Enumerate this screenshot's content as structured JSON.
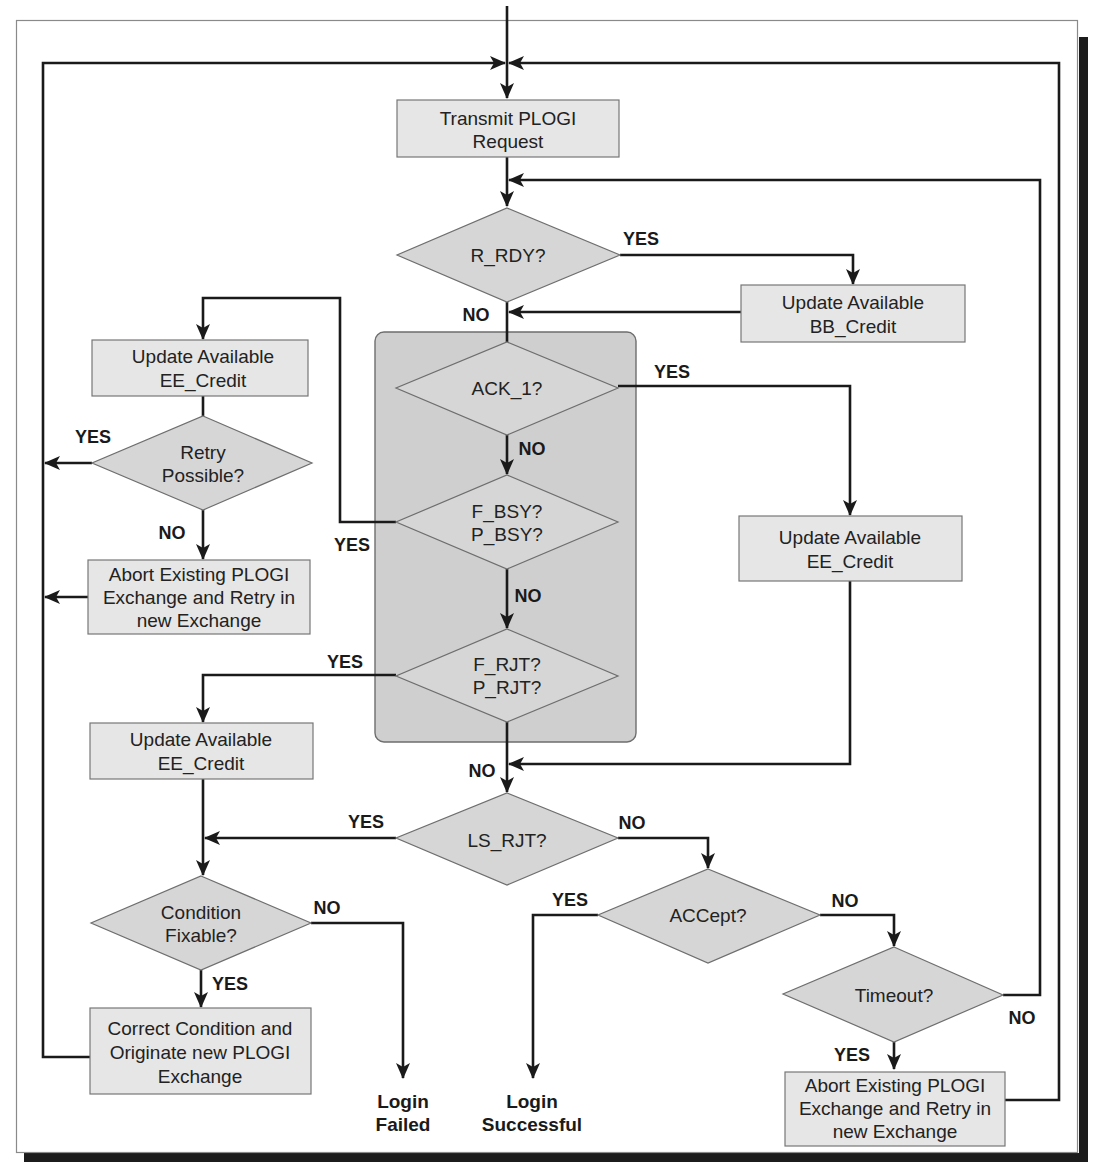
{
  "diagram": {
    "type": "flowchart",
    "title": "",
    "colors": {
      "process_fill": "#e6e6e6",
      "decision_fill": "#d6d6d6",
      "group_fill": "#cfcfcf",
      "line": "#1a1a1a",
      "frame_shadow": "#1c1c1c"
    },
    "nodes": {
      "transmit": {
        "line1": "Transmit PLOGI",
        "line2": "Request"
      },
      "r_rdy": {
        "line1": "R_RDY?"
      },
      "bb_credit": {
        "line1": "Update Available",
        "line2": "BB_Credit"
      },
      "ack_1": {
        "line1": "ACK_1?"
      },
      "f_bsy": {
        "line1": "F_BSY?",
        "line2": "P_BSY?"
      },
      "f_rjt": {
        "line1": "F_RJT?",
        "line2": "P_RJT?"
      },
      "ee_credit_right": {
        "line1": "Update Available",
        "line2": "EE_Credit"
      },
      "ee_credit_top_left": {
        "line1": "Update Available",
        "line2": "EE_Credit"
      },
      "retry_possible": {
        "line1": "Retry",
        "line2": "Possible?"
      },
      "abort_left": {
        "line1": "Abort Existing PLOGI",
        "line2": "Exchange and Retry in",
        "line3": "new Exchange"
      },
      "ee_credit_mid_left": {
        "line1": "Update Available",
        "line2": "EE_Credit"
      },
      "ls_rjt": {
        "line1": "LS_RJT?"
      },
      "condition_fixable": {
        "line1": "Condition",
        "line2": "Fixable?"
      },
      "correct_condition": {
        "line1": "Correct Condition and",
        "line2": "Originate new PLOGI",
        "line3": "Exchange"
      },
      "login_failed": {
        "line1": "Login",
        "line2": "Failed"
      },
      "accept": {
        "line1": "ACCept?"
      },
      "login_successful": {
        "line1": "Login",
        "line2": "Successful"
      },
      "timeout": {
        "line1": "Timeout?"
      },
      "abort_right": {
        "line1": "Abort Existing PLOGI",
        "line2": "Exchange and Retry in",
        "line3": "new Exchange"
      }
    },
    "edge_labels": {
      "r_rdy_yes": "YES",
      "r_rdy_no": "NO",
      "ack_1_yes": "YES",
      "ack_1_no": "NO",
      "f_bsy_yes": "YES",
      "f_bsy_no": "NO",
      "f_rjt_yes": "YES",
      "f_rjt_no": "NO",
      "retry_yes": "YES",
      "retry_no": "NO",
      "ls_rjt_yes": "YES",
      "ls_rjt_no": "NO",
      "condition_no": "NO",
      "condition_yes": "YES",
      "accept_yes": "YES",
      "accept_no": "NO",
      "timeout_no": "NO",
      "timeout_yes": "YES"
    }
  }
}
